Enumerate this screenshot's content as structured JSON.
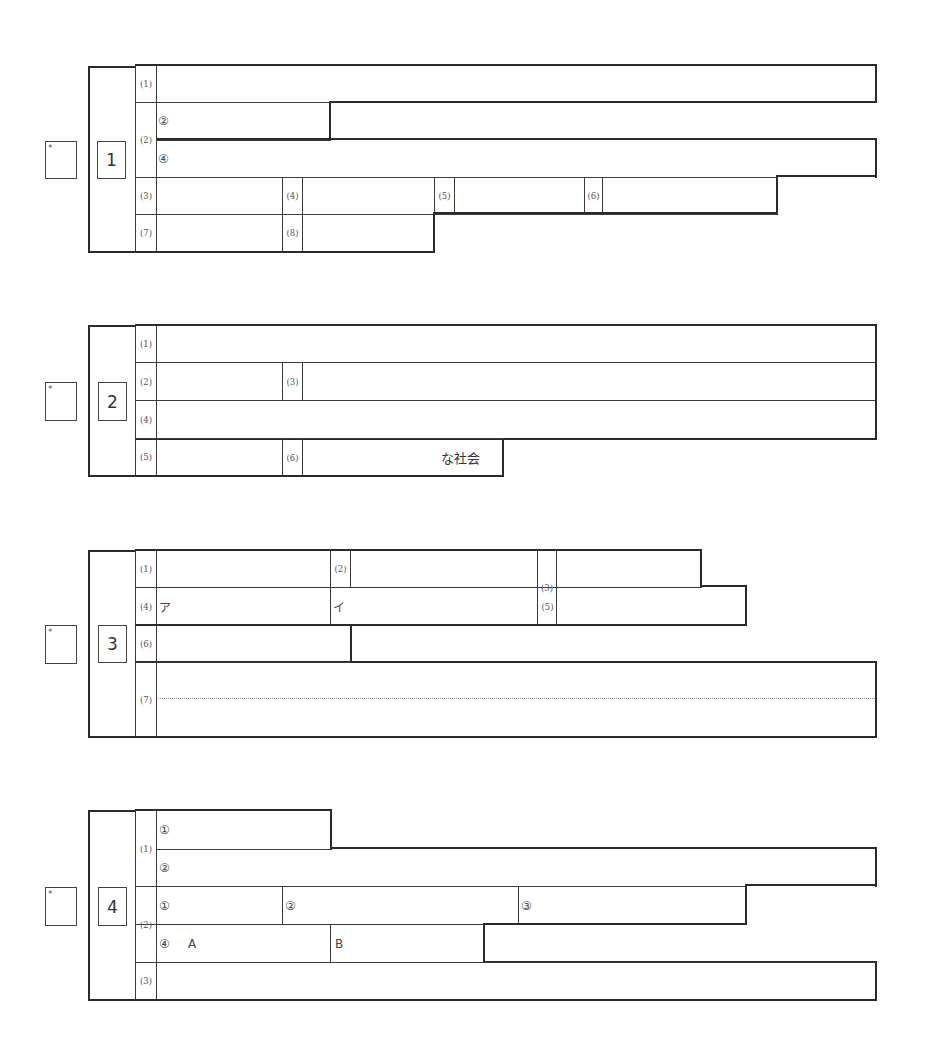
{
  "score_marker": "*",
  "sections": [
    {
      "number": "1",
      "labels": {
        "q1": "(1)",
        "q2": "(2)",
        "q3": "(3)",
        "q4": "(4)",
        "q5": "(5)",
        "q6": "(6)",
        "q7": "(7)",
        "q8": "(8)"
      },
      "sub_marks": {
        "q2_a": "②",
        "q2_b": "④"
      }
    },
    {
      "number": "2",
      "labels": {
        "q1": "(1)",
        "q2": "(2)",
        "q3": "(3)",
        "q4": "(4)",
        "q5": "(5)",
        "q6": "(6)"
      },
      "q6_suffix": "な社会"
    },
    {
      "number": "3",
      "labels": {
        "q1": "(1)",
        "q2": "(2)",
        "q3": "(3)",
        "q4": "(4)",
        "q5": "(5)",
        "q6": "(6)",
        "q7": "(7)"
      },
      "sub_marks": {
        "q4_a": "ア",
        "q4_b": "イ"
      }
    },
    {
      "number": "4",
      "labels": {
        "q1": "(1)",
        "q2": "(2)",
        "q3": "(3)"
      },
      "sub_marks": {
        "q1_1": "①",
        "q1_2": "②",
        "q2_1": "①",
        "q2_2": "②",
        "q2_3": "③",
        "q2_4": "④",
        "q2_4_a": "A",
        "q2_4_b": "B"
      }
    }
  ]
}
